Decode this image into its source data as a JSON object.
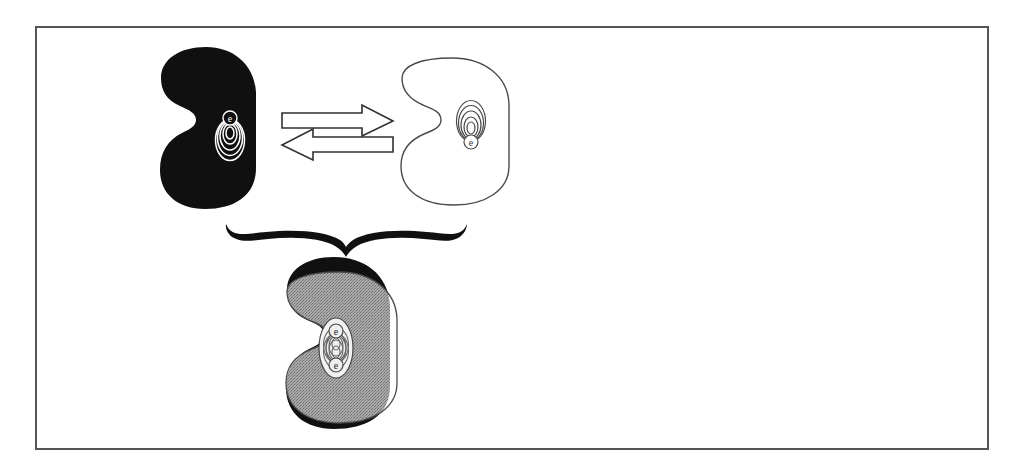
{
  "figure": {
    "title": "Conformational equilibrium of a receptor protein with superimposed overlay",
    "frame": {
      "border_color": "#555555",
      "border_width_px": 2,
      "background_color": "#ffffff",
      "x": 35,
      "y": 26,
      "width": 954,
      "height": 424
    },
    "palette": {
      "black": "#101010",
      "gray_overlap": "#9d9d9d",
      "white": "#ffffff",
      "outline": "#3a3a3a",
      "frame_border": "#555555"
    },
    "elements": [
      {
        "id": "left-conformer",
        "role": "filled-state-shape",
        "fill": "#101010",
        "stroke": "none",
        "label": "",
        "site_mark": {
          "letter": "e",
          "letter_position": "top",
          "contour_rings": 5,
          "color": "#ffffff"
        },
        "bbox": {
          "x": 160,
          "y": 47,
          "width": 96,
          "height": 162
        }
      },
      {
        "id": "equilibrium-arrows",
        "role": "reversible-reaction-arrows",
        "fill": "#ffffff",
        "stroke": "#303030",
        "arrow_top_direction": "right",
        "arrow_bottom_direction": "left",
        "bbox": {
          "x": 281,
          "y": 104,
          "width": 113,
          "height": 50
        }
      },
      {
        "id": "right-conformer",
        "role": "outline-state-shape",
        "fill": "#ffffff",
        "stroke": "#4a4a4a",
        "label": "",
        "site_mark": {
          "letter": "e",
          "letter_position": "bottom",
          "contour_rings": 5,
          "color": "#4a4a4a"
        },
        "bbox": {
          "x": 400,
          "y": 58,
          "width": 110,
          "height": 148
        }
      },
      {
        "id": "summary-brace",
        "role": "downward-curly-brace",
        "stroke": "#101010",
        "span_x": [
          225,
          470
        ],
        "apex": {
          "x": 346,
          "y": 246
        }
      },
      {
        "id": "composite-overlay",
        "role": "superimposed-states",
        "regions": [
          {
            "name": "black-only",
            "fill": "#101010"
          },
          {
            "name": "overlap",
            "fill": "#9d9d9d"
          },
          {
            "name": "outline-only",
            "fill": "#ffffff",
            "stroke": "#4a4a4a"
          }
        ],
        "site_mark": {
          "letters": [
            "e",
            "e"
          ],
          "letter_positions": [
            "top",
            "bottom"
          ],
          "contour_rings": 5,
          "pattern": "interleaved-hourglass"
        },
        "bbox": {
          "x": 275,
          "y": 257,
          "width": 125,
          "height": 172
        }
      }
    ]
  }
}
